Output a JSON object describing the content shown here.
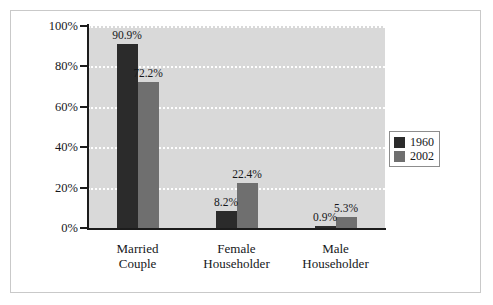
{
  "chart_data": {
    "type": "bar",
    "title": "",
    "subtitle": "",
    "xlabel": "",
    "ylabel": "",
    "ylim": [
      0,
      100
    ],
    "yticks": [
      "0%",
      "20%",
      "40%",
      "60%",
      "80%",
      "100%"
    ],
    "ytick_values": [
      0,
      20,
      40,
      60,
      80,
      100
    ],
    "grid": true,
    "grid_style": "white dotted horizontal",
    "legend_position": "right",
    "categories": [
      "Married\nCouple",
      "Female\nHouseholder",
      "Male\nHouseholder"
    ],
    "category_lines": [
      [
        "Married",
        "Couple"
      ],
      [
        "Female",
        "Householder"
      ],
      [
        "Male",
        "Householder"
      ]
    ],
    "series": [
      {
        "name": "1960",
        "color": "#2b2b2b",
        "values": [
          90.9,
          8.2,
          0.9
        ],
        "labels": [
          "90.9%",
          "8.2%",
          "0.9%"
        ]
      },
      {
        "name": "2002",
        "color": "#6f6f6f",
        "values": [
          72.2,
          22.4,
          5.3
        ],
        "labels": [
          "72.2%",
          "22.4%",
          "5.3%"
        ]
      }
    ]
  },
  "legend": {
    "entries": [
      {
        "label": "1960",
        "color": "#2b2b2b"
      },
      {
        "label": "2002",
        "color": "#6f6f6f"
      }
    ]
  },
  "colors": {
    "plot_background": "#d9d9d9",
    "page_background": "#ffffff",
    "axis": "#1c1c1c",
    "gridline": "#ffffff",
    "frame_border": "#c9c9c9",
    "series_1960": "#2b2b2b",
    "series_2002": "#6f6f6f",
    "text": "#15171a"
  }
}
